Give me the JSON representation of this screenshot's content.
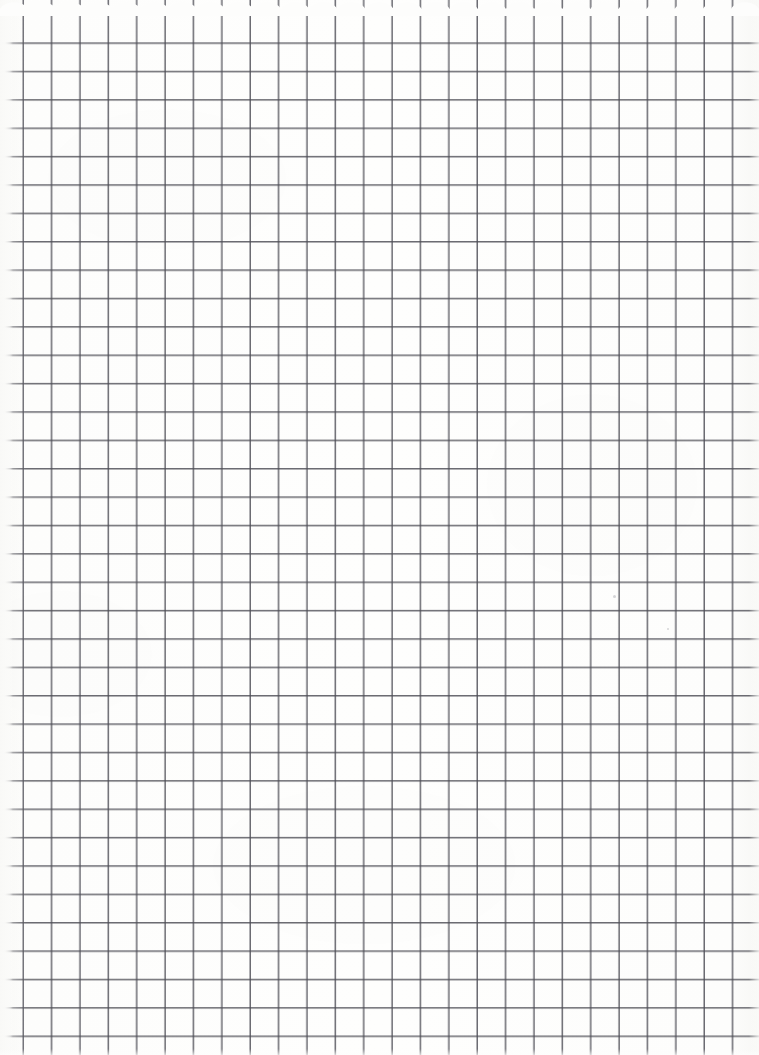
{
  "document": {
    "kind": "scanned-grid-paper",
    "title": "Blank graph paper sheet",
    "page_width": 759,
    "page_height": 1055,
    "has_text": false,
    "has_handwriting": false,
    "visible_text": ""
  },
  "paper": {
    "background_color": "#fdfdfc",
    "edge_tint_color": "#f2f2f0",
    "left_margin_px": 13,
    "top_edge_style": "scalloped",
    "top_edge_bump_count": 27
  },
  "grid": {
    "line_color": "#4d4d55",
    "line_width_px": 2,
    "cell_size_px": 28.38,
    "vertical_line_count": 26,
    "horizontal_line_count": 37,
    "first_vertical_x": 24,
    "first_horizontal_y": 14,
    "orientation": "square",
    "blur_px": 0.32
  },
  "marks": [
    {
      "name": "scan-speck-upper-right",
      "x": 613,
      "y": 595,
      "size": 3
    },
    {
      "name": "scan-speck-mid-right",
      "x": 667,
      "y": 628,
      "size": 2
    }
  ]
}
